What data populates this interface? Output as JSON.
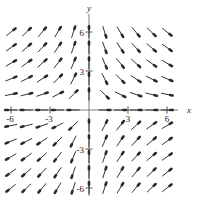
{
  "chart_data": {
    "type": "scatter",
    "title": "",
    "subtitle": "",
    "xlabel": "x",
    "ylabel": "y",
    "xlim": [
      -7.5,
      7.5
    ],
    "ylim": [
      -7.5,
      7.5
    ],
    "grid": false,
    "legend": null,
    "x_ticks": [
      -6,
      -3,
      3,
      6
    ],
    "x_tick_labels": [
      "-6",
      "-3",
      "3",
      "6"
    ],
    "y_ticks": [
      -6,
      -3,
      3,
      6
    ],
    "y_tick_labels": [
      "-6",
      "-3",
      "3",
      "6"
    ],
    "field_description": "direction field of arrows on an 11 by 11 grid",
    "grid_x": [
      -6,
      -4.8,
      -3.6,
      -2.4,
      -1.2,
      0,
      1.2,
      2.4,
      3.6,
      4.8,
      6
    ],
    "grid_y": [
      6,
      4.8,
      3.6,
      2.4,
      1.2,
      0,
      -1.2,
      -2.4,
      -3.6,
      -4.8,
      -6
    ],
    "vectors": [
      {
        "x": -6,
        "y": 6,
        "u": 0.78,
        "v": 0.63
      },
      {
        "x": -4.8,
        "y": 6,
        "u": 0.72,
        "v": 0.69
      },
      {
        "x": -3.6,
        "y": 6,
        "u": 0.64,
        "v": 0.77
      },
      {
        "x": -2.4,
        "y": 6,
        "u": 0.51,
        "v": 0.86
      },
      {
        "x": -1.2,
        "y": 6,
        "u": 0.3,
        "v": 0.95
      },
      {
        "x": 0,
        "y": 6,
        "u": 0,
        "v": 1
      },
      {
        "x": 1.2,
        "y": 6,
        "u": 0.3,
        "v": -0.95
      },
      {
        "x": 2.4,
        "y": 6,
        "u": 0.51,
        "v": -0.86
      },
      {
        "x": 3.6,
        "y": 6,
        "u": 0.64,
        "v": -0.77
      },
      {
        "x": 4.8,
        "y": 6,
        "u": 0.72,
        "v": -0.69
      },
      {
        "x": 6,
        "y": 6,
        "u": 0.78,
        "v": -0.63
      },
      {
        "x": -6,
        "y": 4.8,
        "u": 0.81,
        "v": 0.58
      },
      {
        "x": -4.8,
        "y": 4.8,
        "u": 0.76,
        "v": 0.65
      },
      {
        "x": -3.6,
        "y": 4.8,
        "u": 0.68,
        "v": 0.73
      },
      {
        "x": -2.4,
        "y": 4.8,
        "u": 0.56,
        "v": 0.83
      },
      {
        "x": -1.2,
        "y": 4.8,
        "u": 0.33,
        "v": 0.94
      },
      {
        "x": 0,
        "y": 4.8,
        "u": 0,
        "v": 1
      },
      {
        "x": 1.2,
        "y": 4.8,
        "u": 0.33,
        "v": -0.94
      },
      {
        "x": 2.4,
        "y": 4.8,
        "u": 0.56,
        "v": -0.83
      },
      {
        "x": 3.6,
        "y": 4.8,
        "u": 0.68,
        "v": -0.73
      },
      {
        "x": 4.8,
        "y": 4.8,
        "u": 0.76,
        "v": -0.65
      },
      {
        "x": 6,
        "y": 4.8,
        "u": 0.81,
        "v": -0.58
      },
      {
        "x": -6,
        "y": 3.6,
        "u": 0.86,
        "v": 0.51
      },
      {
        "x": -4.8,
        "y": 3.6,
        "u": 0.81,
        "v": 0.58
      },
      {
        "x": -3.6,
        "y": 3.6,
        "u": 0.74,
        "v": 0.67
      },
      {
        "x": -2.4,
        "y": 3.6,
        "u": 0.62,
        "v": 0.78
      },
      {
        "x": -1.2,
        "y": 3.6,
        "u": 0.38,
        "v": 0.92
      },
      {
        "x": 0,
        "y": 3.6,
        "u": 0,
        "v": 1
      },
      {
        "x": 1.2,
        "y": 3.6,
        "u": 0.38,
        "v": -0.92
      },
      {
        "x": 2.4,
        "y": 3.6,
        "u": 0.62,
        "v": -0.78
      },
      {
        "x": 3.6,
        "y": 3.6,
        "u": 0.74,
        "v": -0.67
      },
      {
        "x": 4.8,
        "y": 3.6,
        "u": 0.81,
        "v": -0.58
      },
      {
        "x": 6,
        "y": 3.6,
        "u": 0.86,
        "v": -0.51
      },
      {
        "x": -6,
        "y": 2.4,
        "u": 0.92,
        "v": 0.38
      },
      {
        "x": -4.8,
        "y": 2.4,
        "u": 0.89,
        "v": 0.45
      },
      {
        "x": -3.6,
        "y": 2.4,
        "u": 0.83,
        "v": 0.55
      },
      {
        "x": -2.4,
        "y": 2.4,
        "u": 0.71,
        "v": 0.71
      },
      {
        "x": -1.2,
        "y": 2.4,
        "u": 0.45,
        "v": 0.89
      },
      {
        "x": 0,
        "y": 2.4,
        "u": 0,
        "v": 1
      },
      {
        "x": 1.2,
        "y": 2.4,
        "u": 0.45,
        "v": -0.89
      },
      {
        "x": 2.4,
        "y": 2.4,
        "u": 0.71,
        "v": -0.71
      },
      {
        "x": 3.6,
        "y": 2.4,
        "u": 0.83,
        "v": -0.55
      },
      {
        "x": 4.8,
        "y": 2.4,
        "u": 0.89,
        "v": -0.45
      },
      {
        "x": 6,
        "y": 2.4,
        "u": 0.92,
        "v": -0.38
      },
      {
        "x": -6,
        "y": 1.2,
        "u": 0.98,
        "v": 0.2
      },
      {
        "x": -4.8,
        "y": 1.2,
        "u": 0.97,
        "v": 0.24
      },
      {
        "x": -3.6,
        "y": 1.2,
        "u": 0.95,
        "v": 0.32
      },
      {
        "x": -2.4,
        "y": 1.2,
        "u": 0.89,
        "v": 0.45
      },
      {
        "x": -1.2,
        "y": 1.2,
        "u": 0.71,
        "v": 0.71
      },
      {
        "x": 0,
        "y": 1.2,
        "u": 0,
        "v": 1
      },
      {
        "x": 1.2,
        "y": 1.2,
        "u": 0.71,
        "v": -0.71
      },
      {
        "x": 2.4,
        "y": 1.2,
        "u": 0.89,
        "v": -0.45
      },
      {
        "x": 3.6,
        "y": 1.2,
        "u": 0.95,
        "v": -0.32
      },
      {
        "x": 4.8,
        "y": 1.2,
        "u": 0.97,
        "v": -0.24
      },
      {
        "x": 6,
        "y": 1.2,
        "u": 0.98,
        "v": -0.2
      },
      {
        "x": -6,
        "y": 0,
        "u": -1,
        "v": 0
      },
      {
        "x": -4.8,
        "y": 0,
        "u": -1,
        "v": 0
      },
      {
        "x": -3.6,
        "y": 0,
        "u": -1,
        "v": 0
      },
      {
        "x": -2.4,
        "y": 0,
        "u": -1,
        "v": 0
      },
      {
        "x": -1.2,
        "y": 0,
        "u": -1,
        "v": 0
      },
      {
        "x": 1.2,
        "y": 0,
        "u": 1,
        "v": 0
      },
      {
        "x": 2.4,
        "y": 0,
        "u": 1,
        "v": 0
      },
      {
        "x": 3.6,
        "y": 0,
        "u": 1,
        "v": 0
      },
      {
        "x": 4.8,
        "y": 0,
        "u": 1,
        "v": 0
      },
      {
        "x": 6,
        "y": 0,
        "u": 1,
        "v": 0
      },
      {
        "x": -6,
        "y": -1.2,
        "u": -0.98,
        "v": -0.2
      },
      {
        "x": -4.8,
        "y": -1.2,
        "u": -0.97,
        "v": -0.24
      },
      {
        "x": -3.6,
        "y": -1.2,
        "u": -0.95,
        "v": -0.32
      },
      {
        "x": -2.4,
        "y": -1.2,
        "u": -0.89,
        "v": -0.45
      },
      {
        "x": -1.2,
        "y": -1.2,
        "u": -0.71,
        "v": -0.71
      },
      {
        "x": 0,
        "y": -1.2,
        "u": 0,
        "v": 1
      },
      {
        "x": 1.2,
        "y": -1.2,
        "u": 0.45,
        "v": 0.89
      },
      {
        "x": 2.4,
        "y": -1.2,
        "u": 0.62,
        "v": 0.78
      },
      {
        "x": 3.6,
        "y": -1.2,
        "u": 0.74,
        "v": 0.67
      },
      {
        "x": 4.8,
        "y": -1.2,
        "u": 0.81,
        "v": 0.58
      },
      {
        "x": 6,
        "y": -1.2,
        "u": 0.86,
        "v": 0.51
      },
      {
        "x": -6,
        "y": -2.4,
        "u": -0.92,
        "v": -0.38
      },
      {
        "x": -4.8,
        "y": -2.4,
        "u": -0.89,
        "v": -0.45
      },
      {
        "x": -3.6,
        "y": -2.4,
        "u": -0.83,
        "v": -0.55
      },
      {
        "x": -2.4,
        "y": -2.4,
        "u": -0.71,
        "v": -0.71
      },
      {
        "x": -1.2,
        "y": -2.4,
        "u": -0.45,
        "v": -0.89
      },
      {
        "x": 0,
        "y": -2.4,
        "u": 0,
        "v": 1
      },
      {
        "x": 1.2,
        "y": -2.4,
        "u": 0.38,
        "v": 0.92
      },
      {
        "x": 2.4,
        "y": -2.4,
        "u": 0.56,
        "v": 0.83
      },
      {
        "x": 3.6,
        "y": -2.4,
        "u": 0.68,
        "v": 0.73
      },
      {
        "x": 4.8,
        "y": -2.4,
        "u": 0.76,
        "v": 0.65
      },
      {
        "x": 6,
        "y": -2.4,
        "u": 0.81,
        "v": 0.58
      },
      {
        "x": -6,
        "y": -3.6,
        "u": -0.86,
        "v": -0.51
      },
      {
        "x": -4.8,
        "y": -3.6,
        "u": -0.81,
        "v": -0.58
      },
      {
        "x": -3.6,
        "y": -3.6,
        "u": -0.74,
        "v": -0.67
      },
      {
        "x": -2.4,
        "y": -3.6,
        "u": -0.62,
        "v": -0.78
      },
      {
        "x": -1.2,
        "y": -3.6,
        "u": -0.38,
        "v": -0.92
      },
      {
        "x": 0,
        "y": -3.6,
        "u": 0,
        "v": 1
      },
      {
        "x": 1.2,
        "y": -3.6,
        "u": 0.33,
        "v": 0.94
      },
      {
        "x": 2.4,
        "y": -3.6,
        "u": 0.56,
        "v": 0.83
      },
      {
        "x": 3.6,
        "y": -3.6,
        "u": 0.68,
        "v": 0.73
      },
      {
        "x": 4.8,
        "y": -3.6,
        "u": 0.76,
        "v": 0.65
      },
      {
        "x": 6,
        "y": -3.6,
        "u": 0.81,
        "v": 0.58
      },
      {
        "x": -6,
        "y": -4.8,
        "u": -0.81,
        "v": -0.58
      },
      {
        "x": -4.8,
        "y": -4.8,
        "u": -0.76,
        "v": -0.65
      },
      {
        "x": -3.6,
        "y": -4.8,
        "u": -0.68,
        "v": -0.73
      },
      {
        "x": -2.4,
        "y": -4.8,
        "u": -0.56,
        "v": -0.83
      },
      {
        "x": -1.2,
        "y": -4.8,
        "u": -0.33,
        "v": -0.94
      },
      {
        "x": 0,
        "y": -4.8,
        "u": 0,
        "v": 1
      },
      {
        "x": 1.2,
        "y": -4.8,
        "u": 0.3,
        "v": 0.95
      },
      {
        "x": 2.4,
        "y": -4.8,
        "u": 0.51,
        "v": 0.86
      },
      {
        "x": 3.6,
        "y": -4.8,
        "u": 0.64,
        "v": 0.77
      },
      {
        "x": 4.8,
        "y": -4.8,
        "u": 0.72,
        "v": 0.69
      },
      {
        "x": 6,
        "y": -4.8,
        "u": 0.78,
        "v": 0.63
      },
      {
        "x": -6,
        "y": -6,
        "u": -0.78,
        "v": -0.63
      },
      {
        "x": -4.8,
        "y": -6,
        "u": -0.72,
        "v": -0.69
      },
      {
        "x": -3.6,
        "y": -6,
        "u": -0.64,
        "v": -0.77
      },
      {
        "x": -2.4,
        "y": -6,
        "u": -0.51,
        "v": -0.86
      },
      {
        "x": -1.2,
        "y": -6,
        "u": -0.3,
        "v": -0.95
      },
      {
        "x": 0,
        "y": -6,
        "u": 0,
        "v": 1
      },
      {
        "x": 1.2,
        "y": -6,
        "u": 0.3,
        "v": 0.95
      },
      {
        "x": 2.4,
        "y": -6,
        "u": 0.51,
        "v": 0.86
      },
      {
        "x": 3.6,
        "y": -6,
        "u": 0.64,
        "v": 0.77
      },
      {
        "x": 4.8,
        "y": -6,
        "u": 0.72,
        "v": 0.69
      },
      {
        "x": 6,
        "y": -6,
        "u": 0.78,
        "v": 0.63
      }
    ]
  },
  "style": {
    "arrow_color": "#2a2a2a",
    "axis_color": "#6d6d6d",
    "label_color": "#1a1a1a",
    "background": "#ffffff"
  }
}
